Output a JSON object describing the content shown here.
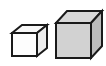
{
  "figure": {
    "name": "two-cubes-size-comparison",
    "description": "Line drawing of two cubes of different sizes shown in oblique projection",
    "background_color": "#ffffff",
    "outline_color": "#1a1a1a",
    "outline_width_px": 2,
    "canvas": {
      "width": 106,
      "height": 66
    }
  },
  "objects": [
    {
      "id": "small-cube",
      "label": "Small cube",
      "size_rank": 1,
      "front_face": {
        "fill": "#fdfdfd",
        "points": "12,33 37,33 37,56 12,56"
      },
      "top_face": {
        "fill": "#f7f7f7",
        "points": "12,33 22,25 47,25 37,33"
      },
      "right_face": {
        "fill": "#ededed",
        "points": "37,33 47,25 47,48 37,56"
      },
      "front_width_px": 25,
      "front_height_px": 23,
      "depth_offset_px": 10
    },
    {
      "id": "large-cube",
      "label": "Large cube",
      "size_rank": 2,
      "front_face": {
        "fill": "#d2d2d2",
        "points": "56,23 91,23 91,58 56,58"
      },
      "top_face": {
        "fill": "#d8d8d8",
        "points": "56,23 67,11 102,11 91,23"
      },
      "right_face": {
        "fill": "#bcbcbc",
        "points": "91,23 102,11 102,46 91,58"
      },
      "front_width_px": 35,
      "front_height_px": 35,
      "depth_offset_px": 11
    }
  ],
  "palette": {
    "outline": "#1a1a1a",
    "small_cube_front": "#fdfdfd",
    "small_cube_top": "#f7f7f7",
    "small_cube_side": "#ededed",
    "large_cube_front": "#d2d2d2",
    "large_cube_top": "#d8d8d8",
    "large_cube_side": "#bcbcbc",
    "background": "#ffffff"
  }
}
